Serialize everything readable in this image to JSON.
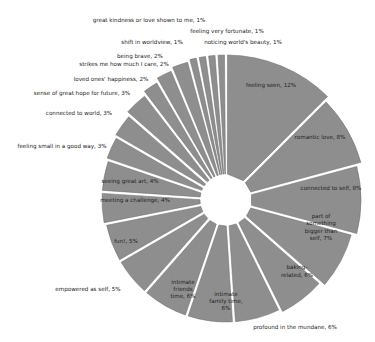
{
  "chart_data": {
    "type": "pie",
    "title": "",
    "center": [
      226,
      200
    ],
    "inner_radius": 20,
    "gap_px": 3,
    "colors": {
      "slice": "#8e8e8e",
      "stroke": "#6a6a6a",
      "background": "#ffffff",
      "text": "#222222"
    },
    "categories": [
      "feeling seen",
      "romantic love",
      "connected to self",
      "part of something bigger than self",
      "baking-related",
      "profound in the mundane",
      "intimate family time",
      "intimate friends time",
      "empowered as self",
      "fun!",
      "meeting a challenge",
      "seeing great art",
      "feeling small in a good way",
      "connected to world",
      "sense of great hope for future",
      "loved ones' happiness",
      "strikes me how much I care",
      "being brave",
      "shift in worldview",
      "great kindness or love shown to me",
      "feeling very fortunate",
      "noticing world's beauty"
    ],
    "values": [
      12,
      8,
      8,
      7,
      6,
      6,
      6,
      6,
      5,
      5,
      4,
      4,
      3,
      3,
      3,
      2,
      2,
      2,
      1,
      1,
      1,
      1
    ],
    "radii": [
      145,
      140,
      135,
      130,
      125,
      122,
      122,
      122,
      122,
      122,
      124,
      124,
      126,
      128,
      132,
      136,
      140,
      143,
      145,
      145,
      145,
      145
    ],
    "labels": [
      {
        "lines": [
          "feeling seen, 12%"
        ],
        "x": 271,
        "y": 85,
        "inside": true
      },
      {
        "lines": [
          "romantic love, 8%"
        ],
        "x": 320,
        "y": 137,
        "inside": true
      },
      {
        "lines": [
          "connected to self, 8%"
        ],
        "x": 331,
        "y": 188,
        "inside": true
      },
      {
        "lines": [
          "part of",
          "something",
          "bigger than",
          "self, 7%"
        ],
        "x": 321,
        "y": 227,
        "inside": true
      },
      {
        "lines": [
          "baking-",
          "related, 6%"
        ],
        "x": 297,
        "y": 271,
        "inside": true
      },
      {
        "lines": [
          "profound in the mundane, 6%"
        ],
        "x": 295,
        "y": 327,
        "inside": false
      },
      {
        "lines": [
          "intimate",
          "family time,",
          "6%"
        ],
        "x": 226,
        "y": 301,
        "inside": true
      },
      {
        "lines": [
          "intimate",
          "friends",
          "time, 6%"
        ],
        "x": 183,
        "y": 289,
        "inside": true
      },
      {
        "lines": [
          "empowered as self, 5%"
        ],
        "x": 88,
        "y": 289,
        "inside": false
      },
      {
        "lines": [
          "fun!, 5%"
        ],
        "x": 126,
        "y": 241,
        "inside": true
      },
      {
        "lines": [
          "meeting a challenge, 4%"
        ],
        "x": 135,
        "y": 200,
        "inside": true
      },
      {
        "lines": [
          "seeing great art, 4%"
        ],
        "x": 130,
        "y": 181,
        "inside": true
      },
      {
        "lines": [
          "feeling small in a good way, 3%"
        ],
        "x": 62,
        "y": 146,
        "inside": false
      },
      {
        "lines": [
          "connected to world, 3%"
        ],
        "x": 79,
        "y": 113,
        "inside": false
      },
      {
        "lines": [
          "sense of great hope for future, 3%"
        ],
        "x": 82,
        "y": 93,
        "inside": false
      },
      {
        "lines": [
          "loved ones' happiness, 2%"
        ],
        "x": 111,
        "y": 79,
        "inside": false
      },
      {
        "lines": [
          "strikes me how much I care, 2%"
        ],
        "x": 124,
        "y": 64,
        "inside": false
      },
      {
        "lines": [
          "being brave, 2%"
        ],
        "x": 140,
        "y": 56,
        "inside": false
      },
      {
        "lines": [
          "shift in worldview, 1%"
        ],
        "x": 152,
        "y": 42,
        "inside": false
      },
      {
        "lines": [
          "great kindness or love shown to me, 1%"
        ],
        "x": 149,
        "y": 20,
        "inside": false
      },
      {
        "lines": [
          "feeling very fortunate, 1%"
        ],
        "x": 227,
        "y": 31,
        "inside": false
      },
      {
        "lines": [
          "noticing world's beauty, 1%"
        ],
        "x": 243,
        "y": 42,
        "inside": false
      }
    ],
    "legend": null,
    "grid": false
  }
}
